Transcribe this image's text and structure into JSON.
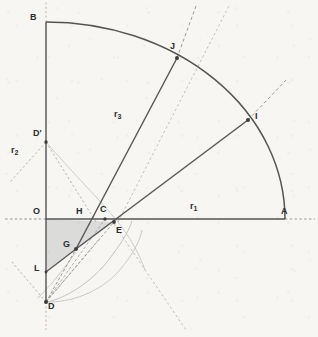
{
  "figure": {
    "background_color": "#f7f6f3",
    "stroke_color": "#595959",
    "light_stroke_color": "#a8a8a8",
    "fill_color": "#c9c9c9",
    "canvas": {
      "width": 318,
      "height": 337
    }
  },
  "points": [
    {
      "id": "B",
      "label": "B",
      "x": 46,
      "y": 22,
      "label_x": 30,
      "label_y": 13,
      "dot": false
    },
    {
      "id": "J",
      "label": "J",
      "x": 177,
      "y": 58,
      "label_x": 170,
      "label_y": 42,
      "dot": true
    },
    {
      "id": "I",
      "label": "I",
      "x": 248,
      "y": 120,
      "label_x": 255,
      "label_y": 112,
      "dot": true
    },
    {
      "id": "Dp",
      "label": "D'",
      "x": 46,
      "y": 142,
      "label_x": 33,
      "label_y": 129,
      "dot": true
    },
    {
      "id": "O",
      "label": "O",
      "x": 46,
      "y": 219,
      "label_x": 34,
      "label_y": 208,
      "dot": false
    },
    {
      "id": "H",
      "label": "H",
      "x": 83,
      "y": 219,
      "label_x": 77,
      "label_y": 208,
      "dot": false
    },
    {
      "id": "C",
      "label": "C",
      "x": 105,
      "y": 219,
      "label_x": 100,
      "label_y": 206,
      "dot": true
    },
    {
      "id": "E",
      "label": "E",
      "x": 114,
      "y": 222,
      "label_x": 116,
      "label_y": 228,
      "dot": true
    },
    {
      "id": "A",
      "label": "A",
      "x": 285,
      "y": 219,
      "label_x": 281,
      "label_y": 208,
      "dot": false
    },
    {
      "id": "G",
      "label": "G",
      "x": 76,
      "y": 249,
      "label_x": 64,
      "label_y": 241,
      "dot": true
    },
    {
      "id": "L",
      "label": "L",
      "x": 46,
      "y": 272,
      "label_x": 35,
      "label_y": 264,
      "dot": false
    },
    {
      "id": "D",
      "label": "D",
      "x": 46,
      "y": 302,
      "label_x": 48,
      "label_y": 303,
      "dot": true
    }
  ],
  "radius_labels": [
    {
      "id": "r1",
      "text": "r",
      "sub": "1",
      "x": 190,
      "y": 204
    },
    {
      "id": "r2",
      "text": "r",
      "sub": "2",
      "x": 11,
      "y": 148
    },
    {
      "id": "r3",
      "text": "r",
      "sub": "3",
      "x": 114,
      "y": 112
    }
  ]
}
